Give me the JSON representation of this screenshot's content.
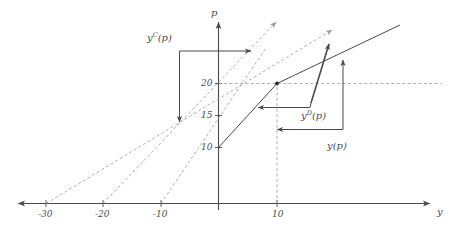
{
  "figure": {
    "kind": "economics-diagram",
    "background_color": "#ffffff",
    "line_color": "#4a4a4a",
    "dashed_color": "#9a9a9a",
    "text_color": "#4a4a4a"
  },
  "axes": {
    "x_axis_label": "y",
    "y_axis_label": "p",
    "x_ticks": [
      {
        "label": "-30",
        "value": -30
      },
      {
        "label": "-20",
        "value": -20
      },
      {
        "label": "-10",
        "value": -10
      },
      {
        "label": "10",
        "value": 10
      }
    ],
    "y_ticks": [
      {
        "label": "10",
        "value": 10
      },
      {
        "label": "15",
        "value": 15
      },
      {
        "label": "20",
        "value": 20
      }
    ],
    "origin_label": "",
    "x_range": [
      -35,
      33
    ],
    "y_range": [
      0,
      33
    ]
  },
  "curves": [
    {
      "name": "yC(p)",
      "label": "y",
      "superscript": "C",
      "label_suffix": "(p)",
      "style": "solid-arrow-bracket",
      "description": "Leftmost bracket with arrows marking the y^C(p) response region"
    },
    {
      "name": "yD(p)",
      "label": "y",
      "superscript": "D",
      "label_suffix": "(p)",
      "style": "solid-arrow-bracket",
      "description": "Inner bracket with steep arrow marking the y^D(p) response region"
    },
    {
      "name": "y(p)",
      "label": "y",
      "superscript": "",
      "label_suffix": "(p)",
      "style": "solid-arrow-bracket",
      "description": "Outer bracket with arrows marking the aggregate y(p) region"
    }
  ],
  "dashed_lines": [
    {
      "name": "supply-line-a",
      "x_intercept": -30,
      "slope_note": "shallowest dashed ray"
    },
    {
      "name": "supply-line-b",
      "x_intercept": -20,
      "slope_note": "middle dashed ray"
    },
    {
      "name": "supply-line-c",
      "x_intercept": -10,
      "slope_note": "steepest dashed ray"
    },
    {
      "name": "price-level-20",
      "value": 20,
      "orientation": "horizontal"
    },
    {
      "name": "quantity-level-10",
      "value": 10,
      "orientation": "vertical"
    }
  ],
  "solid_lines": [
    {
      "name": "aggregate-curve",
      "points_note": "kinked solid line through (0,10) and (10,20)"
    }
  ],
  "markers": [
    {
      "name": "equilibrium-point",
      "x": 10,
      "y": 20
    }
  ],
  "labels": {
    "yc": {
      "base": "y",
      "sup": "C",
      "tail": "(p)"
    },
    "yd": {
      "base": "y",
      "sup": "D",
      "tail": "(p)"
    },
    "y": {
      "base": "y",
      "sup": "",
      "tail": "(p)"
    },
    "p_axis": "p",
    "y_axis": "y"
  }
}
